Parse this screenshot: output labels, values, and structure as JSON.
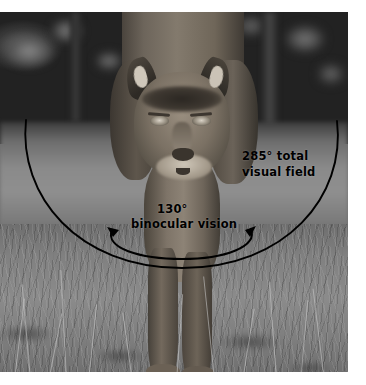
{
  "figure": {
    "kind": "annotated-photograph",
    "palette": {
      "page_background": "#ffffff",
      "annotation_stroke": "#000000",
      "label_text": "#000000",
      "photo_tone": "grayscale"
    }
  },
  "annotations": {
    "outer_arc": {
      "label_line1": "285° total",
      "label_line2": "visual field",
      "degrees": 285,
      "has_arrowheads": false
    },
    "inner_arc": {
      "label_line1": "130°",
      "label_line2": "binocular vision",
      "degrees": 130,
      "has_arrowheads": true,
      "arrowhead_directions": [
        "left",
        "right"
      ]
    }
  }
}
